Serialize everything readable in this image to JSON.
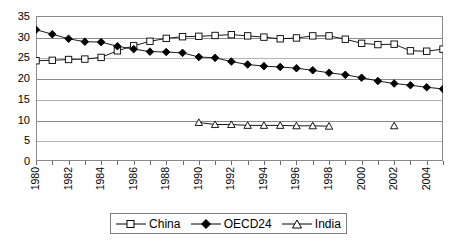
{
  "chart_data": {
    "type": "line",
    "title": "",
    "subtitle": "",
    "xlabel": "",
    "ylabel": "",
    "xlim": [
      1980,
      2005
    ],
    "ylim": [
      0,
      35
    ],
    "y_ticks": [
      0,
      5,
      10,
      15,
      20,
      25,
      30,
      35
    ],
    "x_ticks": [
      1980,
      1981,
      1982,
      1983,
      1984,
      1985,
      1986,
      1987,
      1988,
      1989,
      1990,
      1991,
      1992,
      1993,
      1994,
      1995,
      1996,
      1997,
      1998,
      1999,
      2000,
      2001,
      2002,
      2003,
      2004,
      2005
    ],
    "x_tick_labels": [
      "1980",
      "",
      "1982",
      "",
      "1984",
      "",
      "1986",
      "",
      "1988",
      "",
      "1990",
      "",
      "1992",
      "",
      "1994",
      "",
      "1996",
      "",
      "1998",
      "",
      "2000",
      "",
      "2002",
      "",
      "2004",
      ""
    ],
    "x_tick_label_rotation": 90,
    "grid": "horizontal",
    "legend_position": "bottom",
    "series": [
      {
        "name": "China",
        "marker": "open-square",
        "color": "#000000",
        "x": [
          1980,
          1981,
          1982,
          1983,
          1984,
          1985,
          1986,
          1987,
          1988,
          1989,
          1990,
          1991,
          1992,
          1993,
          1994,
          1995,
          1996,
          1997,
          1998,
          1999,
          2000,
          2001,
          2002,
          2003,
          2004,
          2005
        ],
        "values": [
          24.2,
          24.3,
          24.5,
          24.6,
          25.0,
          26.6,
          27.8,
          28.9,
          29.6,
          30.0,
          30.1,
          30.3,
          30.5,
          30.2,
          29.9,
          29.5,
          29.7,
          30.2,
          30.2,
          29.4,
          28.4,
          28.1,
          28.2,
          26.6,
          26.5,
          27.0
        ]
      },
      {
        "name": "OECD24",
        "marker": "filled-diamond",
        "color": "#000000",
        "x": [
          1980,
          1981,
          1982,
          1983,
          1984,
          1985,
          1986,
          1987,
          1988,
          1989,
          1990,
          1991,
          1992,
          1993,
          1994,
          1995,
          1996,
          1997,
          1998,
          1999,
          2000,
          2001,
          2002,
          2003,
          2004,
          2005
        ],
        "values": [
          31.7,
          30.6,
          29.5,
          28.8,
          28.7,
          27.7,
          27.0,
          26.4,
          26.3,
          26.1,
          25.1,
          24.9,
          24.0,
          23.3,
          22.9,
          22.7,
          22.4,
          21.9,
          21.3,
          20.8,
          20.1,
          19.3,
          18.7,
          18.3,
          17.8,
          17.4
        ]
      },
      {
        "name": "India",
        "marker": "open-triangle",
        "color": "#000000",
        "x": [
          1990,
          1991,
          1992,
          1993,
          1994,
          1995,
          1996,
          1997,
          1998,
          2002
        ],
        "values": [
          9.3,
          8.8,
          8.8,
          8.6,
          8.6,
          8.6,
          8.5,
          8.5,
          8.4,
          8.5
        ],
        "note": "connected 1990-1998; isolated unconnected marker at 2002"
      }
    ],
    "legend": [
      {
        "label": "China",
        "marker": "open-square"
      },
      {
        "label": "OECD24",
        "marker": "filled-diamond"
      },
      {
        "label": "India",
        "marker": "open-triangle"
      }
    ]
  }
}
